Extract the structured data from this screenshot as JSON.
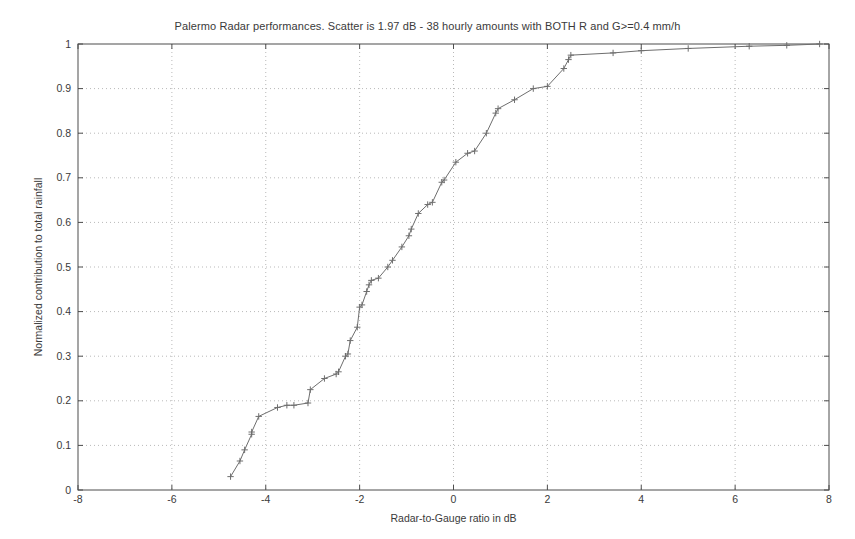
{
  "figure": {
    "background_color": "#ffffff",
    "axes_color": "#4d4d4d",
    "grid_color": "#b9b9b9",
    "series_color": "#6e6e6e"
  },
  "chart_data": {
    "type": "line",
    "title": "Palermo Radar performances. Scatter is 1.97 dB - 38 hourly amounts with BOTH R and G>=0.4 mm/h",
    "xlabel": "Radar-to-Gauge ratio in dB",
    "ylabel": "Normalized contribution to total rainfall",
    "xlim": [
      -8,
      8
    ],
    "ylim": [
      0,
      1
    ],
    "xticks": [
      -8,
      -6,
      -4,
      -2,
      0,
      2,
      4,
      6,
      8
    ],
    "xticklabels": [
      "-8",
      "-6",
      "-4",
      "-2",
      "0",
      "2",
      "4",
      "6",
      "8"
    ],
    "yticks": [
      0,
      0.1,
      0.2,
      0.3,
      0.4,
      0.5,
      0.6,
      0.7,
      0.8,
      0.9,
      1
    ],
    "yticklabels": [
      "0",
      "0.1",
      "0.2",
      "0.3",
      "0.4",
      "0.5",
      "0.6",
      "0.7",
      "0.8",
      "0.9",
      "1"
    ],
    "grid": true,
    "grid_style": "dotted",
    "legend": null,
    "marker": "plus",
    "series": [
      {
        "name": "cumulative-contribution",
        "x": [
          -4.75,
          -4.55,
          -4.45,
          -4.3,
          -4.3,
          -4.15,
          -3.75,
          -3.55,
          -3.4,
          -3.1,
          -3.05,
          -2.75,
          -2.5,
          -2.45,
          -2.3,
          -2.25,
          -2.2,
          -2.05,
          -2.0,
          -1.95,
          -1.85,
          -1.8,
          -1.75,
          -1.6,
          -1.4,
          -1.3,
          -1.1,
          -0.95,
          -0.9,
          -0.75,
          -0.55,
          -0.45,
          -0.25,
          -0.2,
          0.05,
          0.3,
          0.45,
          0.7,
          0.9,
          0.95,
          1.3,
          1.7,
          2.0,
          2.35,
          2.45,
          2.5,
          3.4,
          4.0,
          5.0,
          6.3,
          7.1,
          7.8
        ],
        "y": [
          0.03,
          0.065,
          0.09,
          0.125,
          0.13,
          0.165,
          0.185,
          0.19,
          0.19,
          0.195,
          0.225,
          0.25,
          0.26,
          0.265,
          0.3,
          0.305,
          0.335,
          0.365,
          0.41,
          0.415,
          0.445,
          0.46,
          0.47,
          0.475,
          0.5,
          0.515,
          0.545,
          0.57,
          0.585,
          0.62,
          0.64,
          0.645,
          0.69,
          0.695,
          0.735,
          0.755,
          0.76,
          0.8,
          0.845,
          0.855,
          0.875,
          0.9,
          0.905,
          0.945,
          0.965,
          0.975,
          0.98,
          0.985,
          0.99,
          0.995,
          0.997,
          1.0
        ]
      }
    ]
  }
}
